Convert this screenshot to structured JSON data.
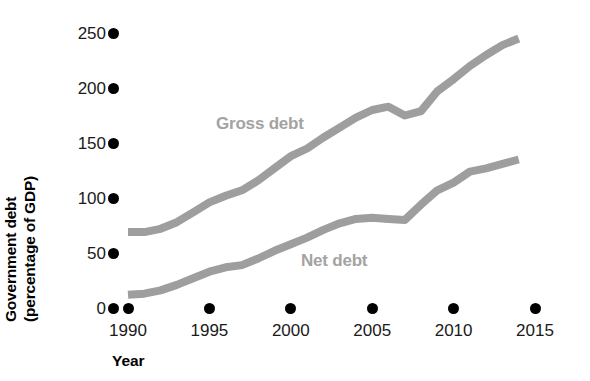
{
  "chart_data": {
    "type": "line",
    "title": "",
    "xlabel": "Year",
    "ylabel": "Government debt (percentage of GDP)",
    "ylabel_line1": "Government debt",
    "ylabel_line2": "(percentage of GDP)",
    "xlim": [
      1990,
      2015
    ],
    "ylim": [
      0,
      250
    ],
    "xticks": [
      1990,
      1995,
      2000,
      2005,
      2010,
      2015
    ],
    "xtick_labels": [
      "1990",
      "1995",
      "2000",
      "2005",
      "2010",
      "2015"
    ],
    "yticks": [
      0,
      50,
      100,
      150,
      200,
      250
    ],
    "ytick_labels": [
      "0",
      "50",
      "100",
      "150",
      "200",
      "250"
    ],
    "grid": false,
    "legend_position": "inline-annotation",
    "line_color": "#9e9e9e",
    "tick_color": "#000000",
    "text_color": "#1a1a1a",
    "series": [
      {
        "name": "Gross debt",
        "label_x": 1998.6,
        "label_y": 168,
        "x": [
          1990,
          1991,
          1992,
          1993,
          1994,
          1995,
          1996,
          1997,
          1998,
          1999,
          2000,
          2001,
          2002,
          2003,
          2004,
          2005,
          2006,
          2007,
          2008,
          2009,
          2010,
          2011,
          2012,
          2013,
          2014
        ],
        "values": [
          69,
          69,
          72,
          78,
          87,
          96,
          102,
          107,
          116,
          127,
          138,
          145,
          155,
          164,
          173,
          180,
          183,
          175,
          179,
          197,
          208,
          220,
          230,
          239,
          245
        ]
      },
      {
        "name": "Net debt",
        "label_x": 2003.2,
        "label_y": 44,
        "x": [
          1990,
          1991,
          1992,
          1993,
          1994,
          1995,
          1996,
          1997,
          1998,
          1999,
          2000,
          2001,
          2002,
          2003,
          2004,
          2005,
          2006,
          2007,
          2008,
          2009,
          2010,
          2011,
          2012,
          2013,
          2014
        ],
        "values": [
          12,
          13,
          16,
          21,
          27,
          33,
          37,
          39,
          45,
          52,
          58,
          64,
          71,
          77,
          81,
          82,
          81,
          80,
          94,
          107,
          114,
          124,
          127,
          131,
          135
        ]
      }
    ]
  },
  "axis": {
    "y_title_line1": "Government debt",
    "y_title_line2": "(percentage of GDP)",
    "x_title": "Year"
  },
  "annotations": {
    "gross": "Gross debt",
    "net": "Net debt"
  }
}
